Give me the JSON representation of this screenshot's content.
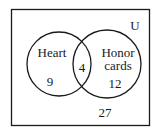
{
  "diagram": {
    "type": "venn",
    "universe_label": "U",
    "sets": [
      {
        "label": "Heart",
        "only_count": "9"
      },
      {
        "label_line1": "Honor",
        "label_line2": "cards",
        "only_count": "12"
      }
    ],
    "intersection_count": "4",
    "outside_count": "27",
    "stroke_color": "#1a1a1a"
  }
}
